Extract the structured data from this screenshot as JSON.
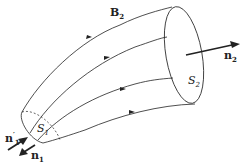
{
  "diagram": {
    "labels": {
      "B2": {
        "main": "B",
        "sub": "2"
      },
      "S1": {
        "main": "S",
        "sub": "1"
      },
      "S2": {
        "main": "S",
        "sub": "2"
      },
      "n2": {
        "main": "n",
        "sub": "2"
      },
      "n1prime": {
        "main": "n",
        "sub": "1",
        "sup": "′"
      },
      "n1": {
        "main": "n",
        "sub": "1"
      }
    },
    "colors": {
      "stroke": "#222222",
      "background": "#ffffff"
    }
  }
}
